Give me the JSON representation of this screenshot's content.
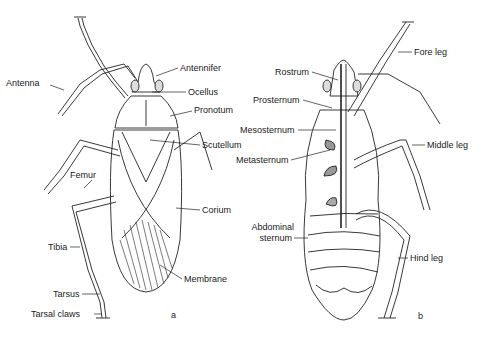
{
  "figure": {
    "panel_a": {
      "letter": "a",
      "labels": {
        "antenna": "Antenna",
        "antennifer": "Antennifer",
        "ocellus": "Ocellus",
        "pronotum": "Pronotum",
        "scutellum": "Scutellum",
        "femur": "Femur",
        "corium": "Corium",
        "tibia": "Tibia",
        "membrane": "Membrane",
        "tarsus": "Tarsus",
        "tarsal_claws": "Tarsal claws"
      }
    },
    "panel_b": {
      "letter": "b",
      "labels": {
        "fore_leg": "Fore leg",
        "rostrum": "Rostrum",
        "prosternum": "Prosternum",
        "mesosternum": "Mesosternum",
        "middle_leg": "Middle leg",
        "metasternum": "Metasternum",
        "abdominal_sternum_1": "Abdominal",
        "abdominal_sternum_2": "sternum",
        "hind_leg": "Hind leg"
      }
    }
  }
}
